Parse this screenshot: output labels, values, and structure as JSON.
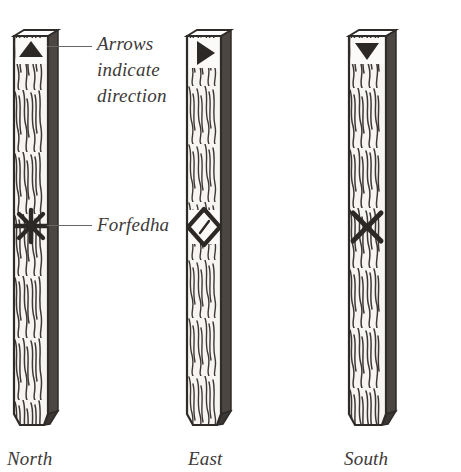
{
  "figure": {
    "background_color": "#ffffff",
    "ink_color": "#3a3532",
    "wood_face_color": "#f6f4f1",
    "shadow_color": "#4a4642"
  },
  "annotations": [
    {
      "id": "arrows",
      "text": "Arrows\nindicate\ndirection",
      "leader_from": "north-stave-arrow",
      "leader_label": "leader-line"
    },
    {
      "id": "forfedha",
      "text": "Forfedha",
      "leader_from": "north-stave-forfedha",
      "leader_label": "leader-line"
    }
  ],
  "staves": [
    {
      "id": "north",
      "caption": "North",
      "arrow_icon": "arrow-up-icon",
      "arrow_direction": "up",
      "forfedha_icon": "asterisk-forfedha-icon",
      "forfedha_shape": "asterisk"
    },
    {
      "id": "east",
      "caption": "East",
      "arrow_icon": "arrow-right-icon",
      "arrow_direction": "right",
      "forfedha_icon": "diamond-forfedha-icon",
      "forfedha_shape": "diamond"
    },
    {
      "id": "south",
      "caption": "South",
      "arrow_icon": "arrow-down-icon",
      "arrow_direction": "down",
      "forfedha_icon": "cross-forfedha-icon",
      "forfedha_shape": "cross"
    }
  ]
}
